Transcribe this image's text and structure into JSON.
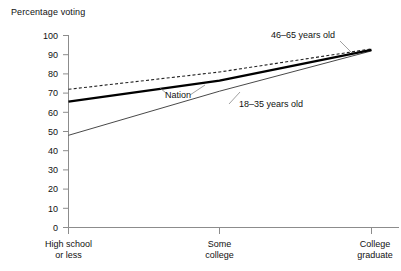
{
  "chart_data": {
    "type": "line",
    "title": "Percentage voting",
    "xlabel": "",
    "ylabel": "Percentage voting",
    "ylim": [
      0,
      100
    ],
    "ytick_step": 10,
    "yticks": [
      "0",
      "10",
      "20",
      "30",
      "40",
      "50",
      "60",
      "70",
      "80",
      "90",
      "100"
    ],
    "grid": false,
    "legend_position": "inline-annotations",
    "categories": [
      "High school or less",
      "Some college",
      "College graduate"
    ],
    "category_lines": [
      [
        "High school",
        "or less"
      ],
      [
        "Some",
        "college"
      ],
      [
        "College",
        "graduate"
      ]
    ],
    "series": [
      {
        "name": "46–65 years old",
        "style": "dashed",
        "color": "#222222",
        "values": [
          72,
          81,
          93
        ]
      },
      {
        "name": "Nation",
        "style": "solid-thick",
        "color": "#000000",
        "values": [
          65.5,
          76.5,
          92.5
        ]
      },
      {
        "name": "18–35 years old",
        "style": "solid-thin",
        "color": "#333333",
        "values": [
          48,
          71,
          92
        ]
      }
    ],
    "annotations": [
      {
        "text": "46–65 years old",
        "series": "46–65 years old"
      },
      {
        "text": "Nation",
        "series": "Nation"
      },
      {
        "text": "18–35 years old",
        "series": "18–35 years old"
      }
    ],
    "axis_color": "#8c8c8c"
  }
}
